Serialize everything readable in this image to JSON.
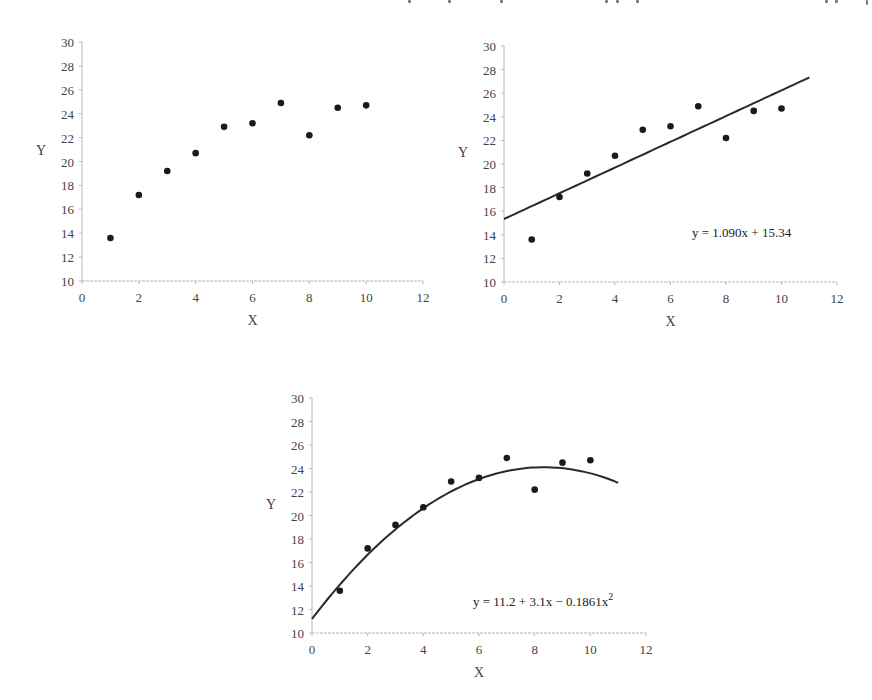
{
  "chart_data": [
    {
      "type": "scatter",
      "title": "",
      "xlabel": "X",
      "ylabel": "Y",
      "xlim": [
        0,
        12
      ],
      "ylim": [
        10,
        30
      ],
      "xticks": [
        "0",
        "2",
        "4",
        "6",
        "8",
        "10",
        "12"
      ],
      "yticks": [
        "10",
        "12",
        "14",
        "16",
        "18",
        "20",
        "22",
        "24",
        "26",
        "28",
        "30"
      ],
      "grid": false,
      "series": [
        {
          "name": "data",
          "x": [
            1,
            2,
            3,
            4,
            5,
            6,
            7,
            8,
            9,
            10
          ],
          "y": [
            13.6,
            17.2,
            19.2,
            20.7,
            22.9,
            23.2,
            24.9,
            22.2,
            24.5,
            24.7
          ]
        }
      ],
      "fit": null,
      "equation": ""
    },
    {
      "type": "scatter",
      "title": "",
      "xlabel": "X",
      "ylabel": "Y",
      "xlim": [
        0,
        12
      ],
      "ylim": [
        10,
        30
      ],
      "xticks": [
        "0",
        "2",
        "4",
        "6",
        "8",
        "10",
        "12"
      ],
      "yticks": [
        "10",
        "12",
        "14",
        "16",
        "18",
        "20",
        "22",
        "24",
        "26",
        "28",
        "30"
      ],
      "grid": false,
      "series": [
        {
          "name": "data",
          "x": [
            1,
            2,
            3,
            4,
            5,
            6,
            7,
            8,
            9,
            10
          ],
          "y": [
            13.6,
            17.2,
            19.2,
            20.7,
            22.9,
            23.2,
            24.9,
            22.2,
            24.5,
            24.7
          ]
        }
      ],
      "fit": {
        "kind": "linear",
        "coefficients": [
          15.34,
          1.09
        ],
        "x_range": [
          0,
          11
        ]
      },
      "equation": "y = 1.090x + 15.34"
    },
    {
      "type": "scatter",
      "title": "",
      "xlabel": "X",
      "ylabel": "Y",
      "xlim": [
        0,
        12
      ],
      "ylim": [
        10,
        30
      ],
      "xticks": [
        "0",
        "2",
        "4",
        "6",
        "8",
        "10",
        "12"
      ],
      "yticks": [
        "10",
        "12",
        "14",
        "16",
        "18",
        "20",
        "22",
        "24",
        "26",
        "28",
        "30"
      ],
      "grid": false,
      "series": [
        {
          "name": "data",
          "x": [
            1,
            2,
            3,
            4,
            5,
            6,
            7,
            8,
            9,
            10
          ],
          "y": [
            13.6,
            17.2,
            19.2,
            20.7,
            22.9,
            23.2,
            24.9,
            22.2,
            24.5,
            24.7
          ]
        }
      ],
      "fit": {
        "kind": "quadratic",
        "coefficients": [
          11.2,
          3.1,
          -0.1861
        ],
        "x_range": [
          0,
          11
        ]
      },
      "equation": "y = 11.2 + 3.1x − 0.1861x",
      "equation_superscript": "2"
    }
  ],
  "colors": {
    "points": "#1a1a1a",
    "fit_line": "#2a2a2a",
    "axis": "#b8b8b8",
    "text": "#444444"
  }
}
